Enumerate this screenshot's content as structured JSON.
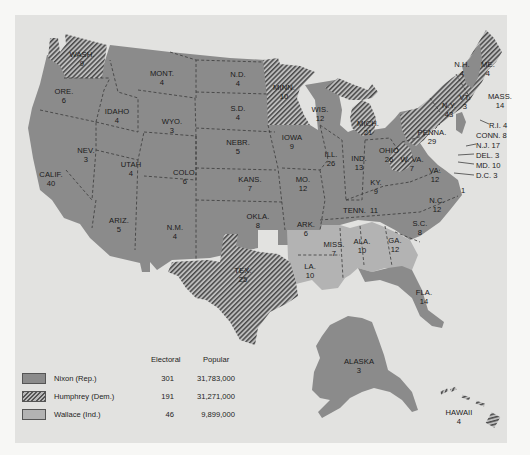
{
  "map": {
    "title": "1968 Presidential Election Results",
    "colors": {
      "nixon": "#8b8b8b",
      "humphrey_hatch": "#555555",
      "wallace": "#b3b3b3",
      "panel_background": "#e2e2e0"
    },
    "states": [
      {
        "abbr": "WASH.",
        "ev": "9",
        "winner": "Humphrey"
      },
      {
        "abbr": "ORE.",
        "ev": "6",
        "winner": "Nixon"
      },
      {
        "abbr": "CALIF.",
        "ev": "40",
        "winner": "Nixon"
      },
      {
        "abbr": "IDAHO",
        "ev": "4",
        "winner": "Nixon"
      },
      {
        "abbr": "NEV.",
        "ev": "3",
        "winner": "Nixon"
      },
      {
        "abbr": "MONT.",
        "ev": "4",
        "winner": "Nixon"
      },
      {
        "abbr": "WYO.",
        "ev": "3",
        "winner": "Nixon"
      },
      {
        "abbr": "UTAH",
        "ev": "4",
        "winner": "Nixon"
      },
      {
        "abbr": "COLO.",
        "ev": "6",
        "winner": "Nixon"
      },
      {
        "abbr": "ARIZ.",
        "ev": "5",
        "winner": "Nixon"
      },
      {
        "abbr": "N.M.",
        "ev": "4",
        "winner": "Nixon"
      },
      {
        "abbr": "N.D.",
        "ev": "4",
        "winner": "Nixon"
      },
      {
        "abbr": "S.D.",
        "ev": "4",
        "winner": "Nixon"
      },
      {
        "abbr": "NEBR.",
        "ev": "5",
        "winner": "Nixon"
      },
      {
        "abbr": "KANS.",
        "ev": "7",
        "winner": "Nixon"
      },
      {
        "abbr": "OKLA.",
        "ev": "8",
        "winner": "Nixon"
      },
      {
        "abbr": "TEX.",
        "ev": "25",
        "winner": "Humphrey"
      },
      {
        "abbr": "MINN.",
        "ev": "10",
        "winner": "Humphrey"
      },
      {
        "abbr": "IOWA",
        "ev": "9",
        "winner": "Nixon"
      },
      {
        "abbr": "MO.",
        "ev": "12",
        "winner": "Nixon"
      },
      {
        "abbr": "ARK.",
        "ev": "6",
        "winner": "Wallace"
      },
      {
        "abbr": "LA.",
        "ev": "10",
        "winner": "Wallace"
      },
      {
        "abbr": "WIS.",
        "ev": "12",
        "winner": "Nixon"
      },
      {
        "abbr": "ILL.",
        "ev": "26",
        "winner": "Nixon"
      },
      {
        "abbr": "MICH.",
        "ev": "21",
        "winner": "Humphrey"
      },
      {
        "abbr": "IND.",
        "ev": "13",
        "winner": "Nixon"
      },
      {
        "abbr": "OHIO",
        "ev": "26",
        "winner": "Nixon"
      },
      {
        "abbr": "KY.",
        "ev": "9",
        "winner": "Nixon"
      },
      {
        "abbr": "TENN.",
        "ev": "11",
        "winner": "Nixon"
      },
      {
        "abbr": "MISS.",
        "ev": "7",
        "winner": "Wallace"
      },
      {
        "abbr": "ALA.",
        "ev": "10",
        "winner": "Wallace"
      },
      {
        "abbr": "GA.",
        "ev": "12",
        "winner": "Wallace"
      },
      {
        "abbr": "FLA.",
        "ev": "14",
        "winner": "Nixon"
      },
      {
        "abbr": "S.C.",
        "ev": "8",
        "winner": "Nixon"
      },
      {
        "abbr": "N.C.",
        "ev": "12",
        "winner": "Nixon"
      },
      {
        "abbr": "VA.",
        "ev": "12",
        "winner": "Nixon"
      },
      {
        "abbr": "W. VA.",
        "ev": "7",
        "winner": "Humphrey"
      },
      {
        "abbr": "PENNA.",
        "ev": "29",
        "winner": "Humphrey"
      },
      {
        "abbr": "N.Y.",
        "ev": "43",
        "winner": "Humphrey"
      },
      {
        "abbr": "VT.",
        "ev": "3",
        "winner": "Nixon"
      },
      {
        "abbr": "N.H.",
        "ev": "4",
        "winner": "Nixon"
      },
      {
        "abbr": "ME.",
        "ev": "4",
        "winner": "Humphrey"
      },
      {
        "abbr": "MASS.",
        "ev": "14",
        "winner": "Humphrey"
      },
      {
        "abbr": "R.I.",
        "ev": "4",
        "winner": "Humphrey"
      },
      {
        "abbr": "CONN.",
        "ev": "8",
        "winner": "Humphrey"
      },
      {
        "abbr": "N.J.",
        "ev": "17",
        "winner": "Nixon"
      },
      {
        "abbr": "DEL.",
        "ev": "3",
        "winner": "Nixon"
      },
      {
        "abbr": "MD.",
        "ev": "10",
        "winner": "Humphrey"
      },
      {
        "abbr": "D.C.",
        "ev": "3",
        "winner": "Humphrey"
      },
      {
        "abbr": "ALASKA",
        "ev": "3",
        "winner": "Nixon"
      },
      {
        "abbr": "HAWAII",
        "ev": "4",
        "winner": "Humphrey"
      }
    ],
    "nc_faithless_marker": "1",
    "east_callouts": [
      {
        "label": "R.I. 4"
      },
      {
        "label": "CONN. 8"
      },
      {
        "label": "N.J. 17"
      },
      {
        "label": "DEL. 3"
      },
      {
        "label": "MD. 10"
      },
      {
        "label": "D.C. 3"
      }
    ]
  },
  "legend": {
    "headers": {
      "electoral": "Electoral",
      "popular": "Popular"
    },
    "rows": [
      {
        "candidate": "Nixon (Rep.)",
        "electoral": "301",
        "popular": "31,783,000",
        "pattern": "nixon"
      },
      {
        "candidate": "Humphrey (Dem.)",
        "electoral": "191",
        "popular": "31,271,000",
        "pattern": "hump"
      },
      {
        "candidate": "Wallace (Ind.)",
        "electoral": "46",
        "popular": "9,899,000",
        "pattern": "wallace"
      }
    ]
  }
}
